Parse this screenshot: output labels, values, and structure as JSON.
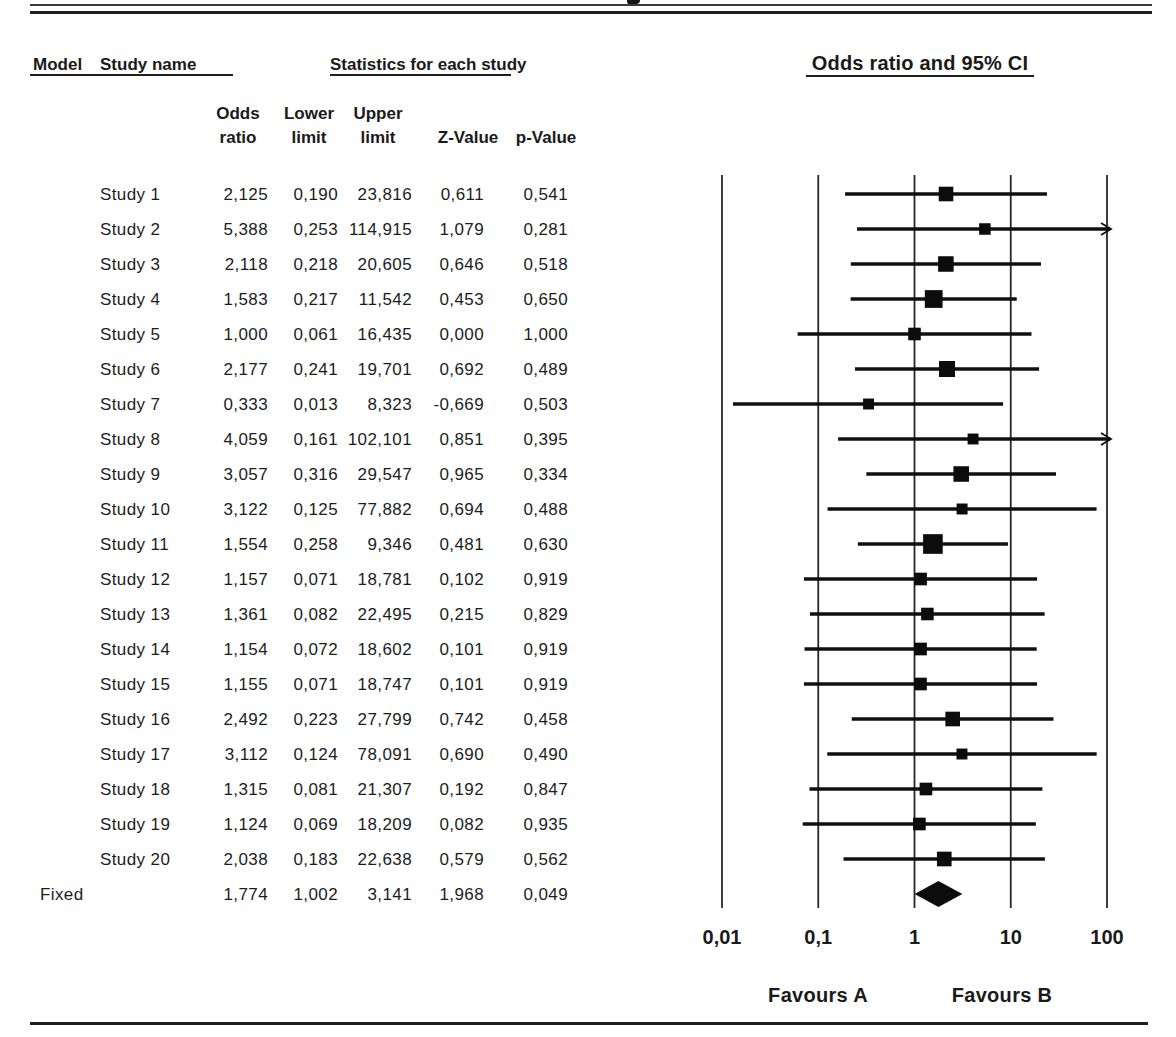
{
  "page": {
    "background": "#ffffff",
    "ink": "#1a1a1a"
  },
  "header": {
    "model": "Model",
    "study_name": "Study name",
    "statistics": "Statistics for each study",
    "plot": "Odds ratio and 95% CI",
    "columns": {
      "odds": [
        "Odds",
        "ratio"
      ],
      "lower": [
        "Lower",
        "limit"
      ],
      "upper": [
        "Upper",
        "limit"
      ],
      "z": "Z-Value",
      "p": "p-Value"
    }
  },
  "chart_data": {
    "type": "forest",
    "effect_measure": "Odds ratio",
    "decimal_separator": ",",
    "value_format": "3 decimals, comma as decimal separator",
    "axis": {
      "scale": "log10",
      "xlim": [
        0.01,
        100
      ],
      "ticks": [
        0.01,
        0.1,
        1,
        10,
        100
      ],
      "tick_labels": [
        "0,01",
        "0,1",
        "1",
        "10",
        "100"
      ]
    },
    "favours": {
      "left": "Favours A",
      "right": "Favours B"
    },
    "studies": [
      {
        "name": "Study 1",
        "odds_ratio": 2.125,
        "ci_lower": 0.19,
        "ci_upper": 23.816,
        "z_value": 0.611,
        "p_value": 0.541
      },
      {
        "name": "Study 2",
        "odds_ratio": 5.388,
        "ci_lower": 0.253,
        "ci_upper": 114.915,
        "z_value": 1.079,
        "p_value": 0.281
      },
      {
        "name": "Study 3",
        "odds_ratio": 2.118,
        "ci_lower": 0.218,
        "ci_upper": 20.605,
        "z_value": 0.646,
        "p_value": 0.518
      },
      {
        "name": "Study 4",
        "odds_ratio": 1.583,
        "ci_lower": 0.217,
        "ci_upper": 11.542,
        "z_value": 0.453,
        "p_value": 0.65
      },
      {
        "name": "Study 5",
        "odds_ratio": 1.0,
        "ci_lower": 0.061,
        "ci_upper": 16.435,
        "z_value": 0.0,
        "p_value": 1.0
      },
      {
        "name": "Study 6",
        "odds_ratio": 2.177,
        "ci_lower": 0.241,
        "ci_upper": 19.701,
        "z_value": 0.692,
        "p_value": 0.489
      },
      {
        "name": "Study 7",
        "odds_ratio": 0.333,
        "ci_lower": 0.013,
        "ci_upper": 8.323,
        "z_value": -0.669,
        "p_value": 0.503
      },
      {
        "name": "Study 8",
        "odds_ratio": 4.059,
        "ci_lower": 0.161,
        "ci_upper": 102.101,
        "z_value": 0.851,
        "p_value": 0.395
      },
      {
        "name": "Study 9",
        "odds_ratio": 3.057,
        "ci_lower": 0.316,
        "ci_upper": 29.547,
        "z_value": 0.965,
        "p_value": 0.334
      },
      {
        "name": "Study 10",
        "odds_ratio": 3.122,
        "ci_lower": 0.125,
        "ci_upper": 77.882,
        "z_value": 0.694,
        "p_value": 0.488
      },
      {
        "name": "Study 11",
        "odds_ratio": 1.554,
        "ci_lower": 0.258,
        "ci_upper": 9.346,
        "z_value": 0.481,
        "p_value": 0.63
      },
      {
        "name": "Study 12",
        "odds_ratio": 1.157,
        "ci_lower": 0.071,
        "ci_upper": 18.781,
        "z_value": 0.102,
        "p_value": 0.919
      },
      {
        "name": "Study 13",
        "odds_ratio": 1.361,
        "ci_lower": 0.082,
        "ci_upper": 22.495,
        "z_value": 0.215,
        "p_value": 0.829
      },
      {
        "name": "Study 14",
        "odds_ratio": 1.154,
        "ci_lower": 0.072,
        "ci_upper": 18.602,
        "z_value": 0.101,
        "p_value": 0.919
      },
      {
        "name": "Study 15",
        "odds_ratio": 1.155,
        "ci_lower": 0.071,
        "ci_upper": 18.747,
        "z_value": 0.101,
        "p_value": 0.919
      },
      {
        "name": "Study 16",
        "odds_ratio": 2.492,
        "ci_lower": 0.223,
        "ci_upper": 27.799,
        "z_value": 0.742,
        "p_value": 0.458
      },
      {
        "name": "Study 17",
        "odds_ratio": 3.112,
        "ci_lower": 0.124,
        "ci_upper": 78.091,
        "z_value": 0.69,
        "p_value": 0.49
      },
      {
        "name": "Study 18",
        "odds_ratio": 1.315,
        "ci_lower": 0.081,
        "ci_upper": 21.307,
        "z_value": 0.192,
        "p_value": 0.847
      },
      {
        "name": "Study 19",
        "odds_ratio": 1.124,
        "ci_lower": 0.069,
        "ci_upper": 18.209,
        "z_value": 0.082,
        "p_value": 0.935
      },
      {
        "name": "Study 20",
        "odds_ratio": 2.038,
        "ci_lower": 0.183,
        "ci_upper": 22.638,
        "z_value": 0.579,
        "p_value": 0.562
      }
    ],
    "summary": {
      "name": "Fixed",
      "odds_ratio": 1.774,
      "ci_lower": 1.002,
      "ci_upper": 3.141,
      "z_value": 1.968,
      "p_value": 0.049
    }
  }
}
